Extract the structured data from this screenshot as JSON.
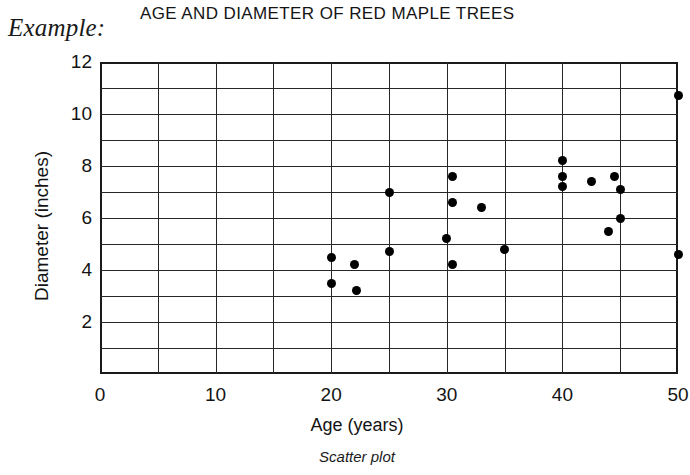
{
  "example_label": "Example:",
  "caption": "Scatter plot",
  "chart_data": {
    "type": "scatter",
    "title": "AGE AND DIAMETER OF RED MAPLE TREES",
    "xlabel": "Age (years)",
    "ylabel": "Diameter (inches)",
    "xlim": [
      0,
      50
    ],
    "ylim": [
      0,
      12
    ],
    "xticks": [
      0,
      10,
      20,
      30,
      40,
      50
    ],
    "yticks": [
      2,
      4,
      6,
      8,
      10,
      12
    ],
    "xtick_labels": [
      "0",
      "10",
      "20",
      "30",
      "40",
      "50"
    ],
    "ytick_labels": [
      "2",
      "4",
      "6",
      "8",
      "10",
      "12"
    ],
    "grid": true,
    "grid_x_step": 5,
    "grid_y_step": 1,
    "legend": null,
    "marker": "filled-circle",
    "marker_color": "#000000",
    "points": [
      {
        "x": 20.0,
        "y": 4.5
      },
      {
        "x": 20.0,
        "y": 3.5
      },
      {
        "x": 22.0,
        "y": 4.2
      },
      {
        "x": 22.2,
        "y": 3.2
      },
      {
        "x": 25.0,
        "y": 7.0
      },
      {
        "x": 25.0,
        "y": 4.7
      },
      {
        "x": 30.5,
        "y": 7.6
      },
      {
        "x": 30.5,
        "y": 6.6
      },
      {
        "x": 30.0,
        "y": 5.2
      },
      {
        "x": 30.5,
        "y": 4.2
      },
      {
        "x": 33.0,
        "y": 6.4
      },
      {
        "x": 35.0,
        "y": 4.8
      },
      {
        "x": 40.0,
        "y": 8.2
      },
      {
        "x": 40.0,
        "y": 7.6
      },
      {
        "x": 40.0,
        "y": 7.2
      },
      {
        "x": 42.5,
        "y": 7.4
      },
      {
        "x": 44.5,
        "y": 7.6
      },
      {
        "x": 45.0,
        "y": 7.1
      },
      {
        "x": 45.0,
        "y": 6.0
      },
      {
        "x": 44.0,
        "y": 5.5
      },
      {
        "x": 50.0,
        "y": 10.7
      },
      {
        "x": 50.0,
        "y": 4.6
      }
    ]
  }
}
